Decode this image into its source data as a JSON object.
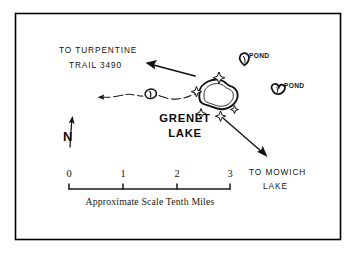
{
  "map": {
    "title": "Grenet Lake trail map",
    "border_color": "#000000",
    "background_color": "#ffffff",
    "ink_color": "#111111",
    "labels": {
      "lake_name_line1": "GRENET",
      "lake_name_line2": "LAKE",
      "route_northwest_line1": "TO TURPENTINE",
      "route_northwest_line2": "TRAIL 3490",
      "route_southeast_line1": "TO MOWICH",
      "route_southeast_line2": "LAKE",
      "pond_upper": "POND",
      "pond_lower": "POND",
      "north_indicator": "N"
    },
    "features": [
      {
        "name": "grenet-lake",
        "type": "lake",
        "label": "GRENET LAKE"
      },
      {
        "name": "pond-upper",
        "type": "pond",
        "label": "POND"
      },
      {
        "name": "pond-lower",
        "type": "pond",
        "label": "POND"
      },
      {
        "name": "trail-pond",
        "type": "pond",
        "label": ""
      },
      {
        "name": "trail-west",
        "type": "trail",
        "label": ""
      },
      {
        "name": "campsite-marker",
        "type": "campsite",
        "count": 5
      }
    ],
    "scale_bar": {
      "ticks": [
        "0",
        "1",
        "2",
        "3"
      ],
      "caption": "Approximate Scale Tenth Miles",
      "units": "Tenth Miles"
    }
  }
}
